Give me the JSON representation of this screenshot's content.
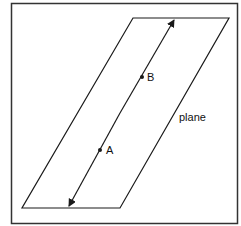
{
  "diagram": {
    "caption": "",
    "labels": {
      "point_a": "A",
      "point_b": "B",
      "plane": "plane"
    },
    "colors": {
      "stroke": "#1a1a1a",
      "frame": "#333333",
      "background": "#ffffff"
    }
  }
}
